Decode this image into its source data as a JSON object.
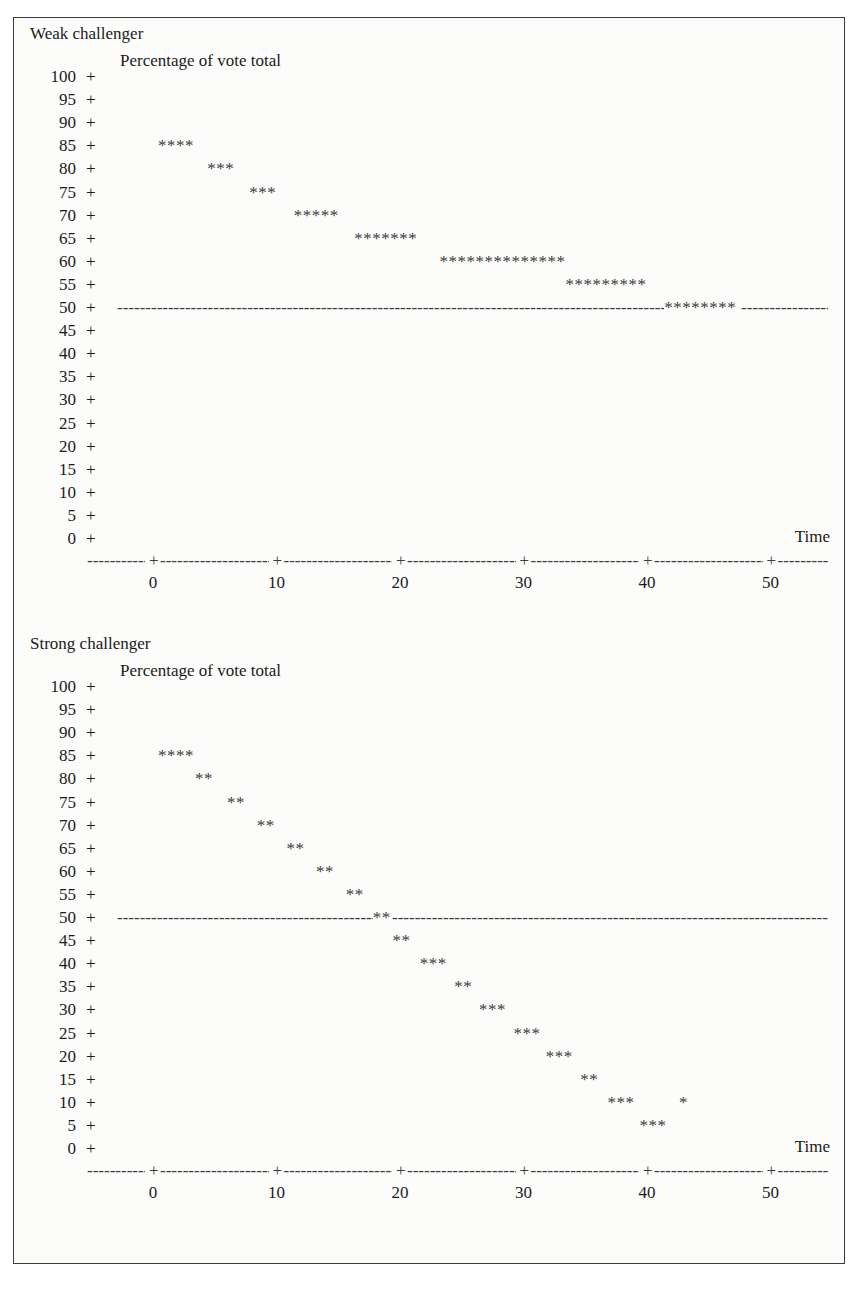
{
  "figure": {
    "background_color": "#fcfcfa",
    "border_color": "#3a3a3a",
    "ink_color": "#3b3b3b",
    "caption": ""
  },
  "axis": {
    "y_tick_symbol": "+",
    "x_tick_symbol": "+",
    "y_title": "Percentage of vote total",
    "x_title": "Time",
    "y_ticks": [
      100,
      95,
      90,
      85,
      80,
      75,
      70,
      65,
      60,
      55,
      50,
      45,
      40,
      35,
      30,
      25,
      20,
      15,
      10,
      5,
      0
    ],
    "x_ticks": [
      0,
      10,
      20,
      30,
      40,
      50
    ],
    "reference_level": 50,
    "marker": "*",
    "dash": "-"
  },
  "panels": [
    {
      "id": "weak",
      "title": "Weak challenger"
    },
    {
      "id": "strong",
      "title": "Strong challenger"
    }
  ],
  "chart_data": [
    {
      "type": "scatter",
      "title": "Weak challenger",
      "subtitle": "Percentage of vote total",
      "xlabel": "Time",
      "ylabel": "Percentage of vote total",
      "xlim": [
        -4,
        56
      ],
      "ylim": [
        0,
        100
      ],
      "ytick_step": 5,
      "xticks": [
        0,
        10,
        20,
        30,
        40,
        50
      ],
      "yticks": [
        100,
        95,
        90,
        85,
        80,
        75,
        70,
        65,
        60,
        55,
        50,
        45,
        40,
        35,
        30,
        25,
        20,
        15,
        10,
        5,
        0
      ],
      "grid": false,
      "legend": null,
      "reference_line": {
        "y": 50,
        "style": "dashed",
        "label": ""
      },
      "marker": "*",
      "rows": [
        {
          "y": 100,
          "runs": []
        },
        {
          "y": 95,
          "runs": []
        },
        {
          "y": 90,
          "runs": []
        },
        {
          "y": 85,
          "runs": [
            {
              "x_start": 0.4,
              "count": 4
            }
          ]
        },
        {
          "y": 80,
          "runs": [
            {
              "x_start": 4.4,
              "count": 3
            }
          ]
        },
        {
          "y": 75,
          "runs": [
            {
              "x_start": 7.8,
              "count": 3
            }
          ]
        },
        {
          "y": 70,
          "runs": [
            {
              "x_start": 11.4,
              "count": 5
            }
          ]
        },
        {
          "y": 65,
          "runs": [
            {
              "x_start": 16.3,
              "count": 7
            }
          ]
        },
        {
          "y": 60,
          "runs": [
            {
              "x_start": 23.2,
              "count": 14
            }
          ]
        },
        {
          "y": 55,
          "runs": [
            {
              "x_start": 33.4,
              "count": 9
            }
          ]
        },
        {
          "y": 50,
          "runs": [
            {
              "x_start": 41.4,
              "count": 8
            }
          ]
        },
        {
          "y": 45,
          "runs": []
        },
        {
          "y": 40,
          "runs": []
        },
        {
          "y": 35,
          "runs": []
        },
        {
          "y": 30,
          "runs": []
        },
        {
          "y": 25,
          "runs": []
        },
        {
          "y": 20,
          "runs": []
        },
        {
          "y": 15,
          "runs": []
        },
        {
          "y": 10,
          "runs": []
        },
        {
          "y": 5,
          "runs": []
        },
        {
          "y": 0,
          "runs": []
        }
      ],
      "series_summary": {
        "name": "challenger vote share",
        "x": [
          0.4,
          4.4,
          7.8,
          11.4,
          16.3,
          23.2,
          33.4,
          41.4
        ],
        "y": [
          85,
          80,
          75,
          70,
          65,
          60,
          55,
          50
        ],
        "description": "Vote share declines from 85% to a plateau at 50% and never falls below the 50% reference line."
      }
    },
    {
      "type": "scatter",
      "title": "Strong challenger",
      "subtitle": "Percentage of vote total",
      "xlabel": "Time",
      "ylabel": "Percentage of vote total",
      "xlim": [
        -4,
        56
      ],
      "ylim": [
        0,
        100
      ],
      "ytick_step": 5,
      "xticks": [
        0,
        10,
        20,
        30,
        40,
        50
      ],
      "yticks": [
        100,
        95,
        90,
        85,
        80,
        75,
        70,
        65,
        60,
        55,
        50,
        45,
        40,
        35,
        30,
        25,
        20,
        15,
        10,
        5,
        0
      ],
      "grid": false,
      "legend": null,
      "reference_line": {
        "y": 50,
        "style": "dashed",
        "label": ""
      },
      "marker": "*",
      "rows": [
        {
          "y": 100,
          "runs": []
        },
        {
          "y": 95,
          "runs": []
        },
        {
          "y": 90,
          "runs": []
        },
        {
          "y": 85,
          "runs": [
            {
              "x_start": 0.4,
              "count": 4
            }
          ]
        },
        {
          "y": 80,
          "runs": [
            {
              "x_start": 3.4,
              "count": 2
            }
          ]
        },
        {
          "y": 75,
          "runs": [
            {
              "x_start": 6.0,
              "count": 2
            }
          ]
        },
        {
          "y": 70,
          "runs": [
            {
              "x_start": 8.4,
              "count": 2
            }
          ]
        },
        {
          "y": 65,
          "runs": [
            {
              "x_start": 10.8,
              "count": 2
            }
          ]
        },
        {
          "y": 60,
          "runs": [
            {
              "x_start": 13.2,
              "count": 2
            }
          ]
        },
        {
          "y": 55,
          "runs": [
            {
              "x_start": 15.6,
              "count": 2
            }
          ]
        },
        {
          "y": 50,
          "runs": [
            {
              "x_start": 17.8,
              "count": 2
            }
          ]
        },
        {
          "y": 45,
          "runs": [
            {
              "x_start": 19.4,
              "count": 2
            }
          ]
        },
        {
          "y": 40,
          "runs": [
            {
              "x_start": 21.6,
              "count": 3
            }
          ]
        },
        {
          "y": 35,
          "runs": [
            {
              "x_start": 24.4,
              "count": 2
            }
          ]
        },
        {
          "y": 30,
          "runs": [
            {
              "x_start": 26.4,
              "count": 3
            }
          ]
        },
        {
          "y": 25,
          "runs": [
            {
              "x_start": 29.2,
              "count": 3
            }
          ]
        },
        {
          "y": 20,
          "runs": [
            {
              "x_start": 31.8,
              "count": 3
            }
          ]
        },
        {
          "y": 15,
          "runs": [
            {
              "x_start": 34.6,
              "count": 2
            }
          ]
        },
        {
          "y": 10,
          "runs": [
            {
              "x_start": 36.8,
              "count": 3
            },
            {
              "x_start": 42.6,
              "count": 1
            }
          ]
        },
        {
          "y": 5,
          "runs": [
            {
              "x_start": 39.4,
              "count": 3
            }
          ]
        },
        {
          "y": 0,
          "runs": []
        }
      ],
      "series_summary": {
        "name": "challenger vote share",
        "x": [
          0.4,
          3.4,
          6.0,
          8.4,
          10.8,
          13.2,
          15.6,
          17.8,
          19.4,
          21.6,
          24.4,
          26.4,
          29.2,
          31.8,
          34.6,
          36.8,
          39.4,
          42.6
        ],
        "y": [
          85,
          80,
          75,
          70,
          65,
          60,
          55,
          50,
          45,
          40,
          35,
          30,
          25,
          20,
          15,
          10,
          5,
          10
        ],
        "description": "Vote share falls steadily from 85% through the 50% reference line near time 18 and continues down to about 5%."
      }
    }
  ]
}
